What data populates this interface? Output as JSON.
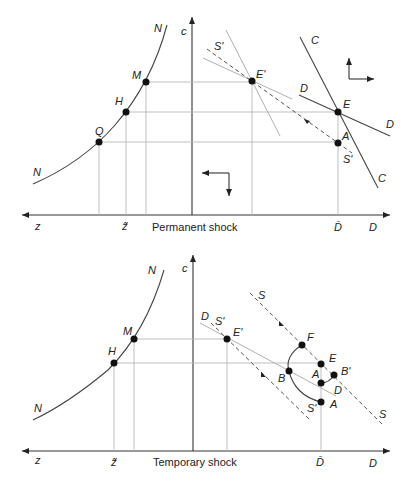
{
  "figure": {
    "panels": [
      {
        "caption": "Permanent shock",
        "axes": {
          "vertical": "c",
          "horizontal_left": "z",
          "horizontal_right": "D",
          "z_tick": "z̃",
          "d_tick": "D̄"
        },
        "curve_labels": {
          "N_top": "N",
          "N_bottom": "N"
        },
        "points": {
          "M": "M",
          "H": "H",
          "Q": "Q",
          "E_prime": "E'",
          "E": "E",
          "A": "A"
        },
        "line_labels": {
          "S_prime_top": "S'",
          "S_prime_bottom": "S'",
          "C_top": "C",
          "C_bottom": "C",
          "D_left": "D",
          "D_right": "D"
        }
      },
      {
        "caption": "Temporary shock",
        "axes": {
          "vertical": "c",
          "horizontal_left": "z",
          "horizontal_right": "D",
          "z_tick": "z̃",
          "d_tick": "D̄"
        },
        "curve_labels": {
          "N_top": "N",
          "N_bottom": "N"
        },
        "points": {
          "M": "M",
          "H": "H",
          "E_prime": "E'",
          "F": "F",
          "E": "E",
          "B": "B",
          "B_prime": "B'",
          "A_upper": "A",
          "A_lower": "A"
        },
        "line_labels": {
          "S_top": "S",
          "S_bottom": "S",
          "S_prime_top": "S'",
          "S_prime_bottom": "S'",
          "D_left": "D",
          "D_right": "D"
        }
      }
    ]
  }
}
